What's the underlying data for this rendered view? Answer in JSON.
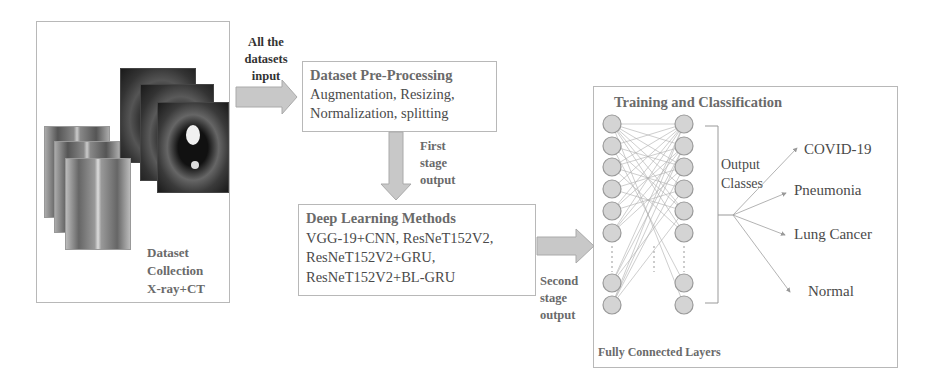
{
  "dataset_collection": {
    "title_lines": [
      "Dataset",
      "Collection",
      "X-ray+CT"
    ],
    "images": {
      "xray_count": 3,
      "ct_count": 3
    }
  },
  "arrow_input_label": [
    "All the",
    "datasets",
    "input"
  ],
  "preprocessing": {
    "title": "Dataset Pre-Processing",
    "lines": [
      "Augmentation, Resizing,",
      "Normalization, splitting"
    ]
  },
  "arrow_first_label": [
    "First",
    "stage",
    "output"
  ],
  "deep_learning": {
    "title": "Deep Learning Methods",
    "lines": [
      "VGG-19+CNN, ResNeT152V2,",
      "ResNeT152V2+GRU,",
      "ResNeT152V2+BL-GRU"
    ]
  },
  "arrow_second_label": [
    "Second",
    "stage",
    "output"
  ],
  "training": {
    "title": "Training and Classification",
    "footer": "Fully Connected Layers",
    "output_label": [
      "Output",
      "Classes"
    ],
    "classes": [
      "COVID-19",
      "Pneumonia",
      "Lung Cancer",
      "Normal"
    ]
  },
  "colors": {
    "border": "#b8b8b8",
    "arrow_fill": "#c8c8c8",
    "node_fill": "#d4d4d4",
    "node_stroke": "#9a9a9a",
    "text": "#4a4a4a"
  }
}
